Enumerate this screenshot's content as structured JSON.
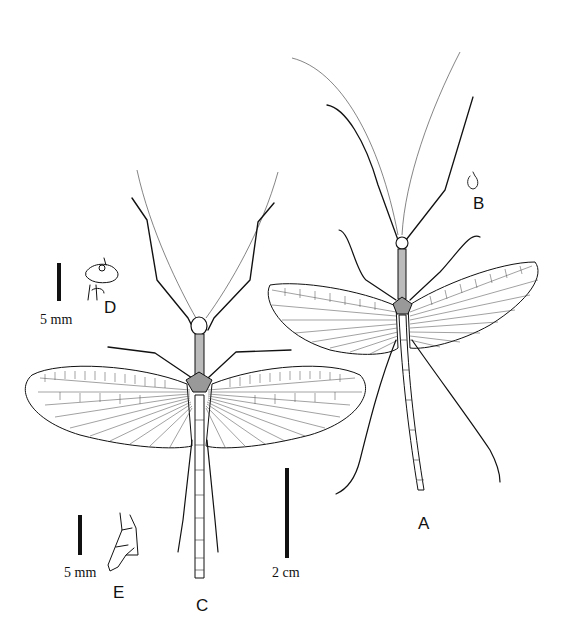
{
  "figure": {
    "type": "scientific line drawing",
    "panels": [
      {
        "id": "A",
        "label": "A",
        "description": "full specimen, right"
      },
      {
        "id": "B",
        "label": "B",
        "description": "small detail sketch"
      },
      {
        "id": "C",
        "label": "C",
        "description": "full specimen, left"
      },
      {
        "id": "D",
        "label": "D",
        "description": "head/thorax detail"
      },
      {
        "id": "E",
        "label": "E",
        "description": "abdomen terminalia detail"
      }
    ],
    "scale_bars": {
      "d": {
        "text": "5 mm"
      },
      "e": {
        "text": "5 mm"
      },
      "main": {
        "text": "2 cm"
      }
    },
    "colors": {
      "ink": "#111111",
      "background": "#ffffff"
    }
  }
}
